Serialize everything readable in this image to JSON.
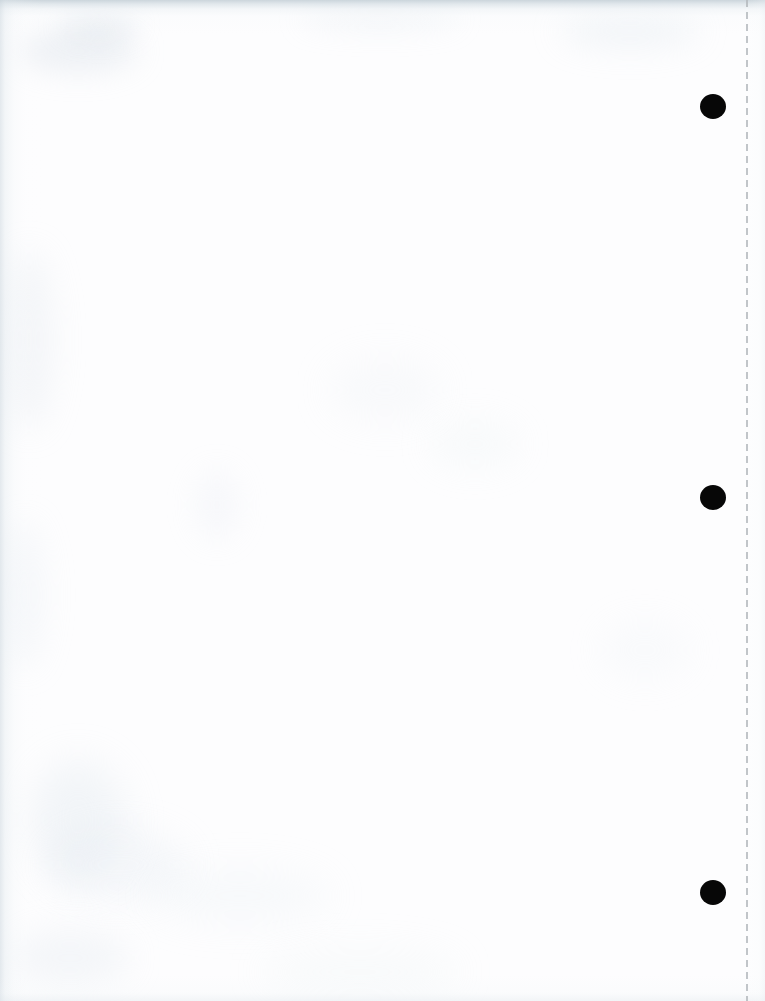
{
  "document": {
    "kind": "scanned-page",
    "description": "Blank scanned sheet of white paper",
    "page_width_px": 765,
    "page_height_px": 1001,
    "text_content": "",
    "paper_color": "#fdfdfe",
    "background_color": "#ffffff"
  },
  "scan_edges": {
    "top": {
      "name": "top-edge-shadow",
      "color": "#c6d1d8",
      "height_px": 34
    },
    "left": {
      "name": "left-edge-shadow",
      "color": "#ced8df",
      "width_px": 44
    },
    "bottom": {
      "name": "bottom-edge-shadow",
      "color": "#e0e7ec",
      "height_px": 26
    },
    "right": {
      "name": "right-edge-shadow",
      "color": "#e9eef2",
      "width_px": 18
    }
  },
  "perforation": {
    "name": "vertical-dashed-tear-line",
    "color": "#b4b9bd",
    "x_px": 746,
    "dash_px": 7,
    "gap_px": 5,
    "thickness_px": 2,
    "opacity": 0.82
  },
  "punch_holes": {
    "color": "#070707",
    "count": 3,
    "diameter_px": 26,
    "items": [
      {
        "name": "punch-hole-top",
        "cx": 713,
        "cy": 107
      },
      {
        "name": "punch-hole-middle",
        "cx": 713,
        "cy": 498
      },
      {
        "name": "punch-hole-bottom",
        "cx": 713,
        "cy": 893
      }
    ]
  },
  "smudges": [
    {
      "name": "smudge-top-left-a",
      "x": 18,
      "y": 30,
      "w": 120,
      "h": 42,
      "color": "rgba(206,216,224,0.30)",
      "blur": 14
    },
    {
      "name": "smudge-top-left-b",
      "x": 60,
      "y": 12,
      "w": 78,
      "h": 26,
      "color": "rgba(198,210,219,0.26)",
      "blur": 12
    },
    {
      "name": "smudge-top-mid",
      "x": 300,
      "y": 8,
      "w": 160,
      "h": 22,
      "color": "rgba(214,224,231,0.22)",
      "blur": 13
    },
    {
      "name": "smudge-top-right",
      "x": 560,
      "y": 14,
      "w": 140,
      "h": 34,
      "color": "rgba(210,221,229,0.24)",
      "blur": 15
    },
    {
      "name": "smudge-left-mid-a",
      "x": 6,
      "y": 250,
      "w": 46,
      "h": 180,
      "color": "rgba(216,226,233,0.26)",
      "blur": 16
    },
    {
      "name": "smudge-left-mid-b",
      "x": 4,
      "y": 520,
      "w": 40,
      "h": 150,
      "color": "rgba(219,229,235,0.22)",
      "blur": 15
    },
    {
      "name": "smudge-center-faint",
      "x": 330,
      "y": 360,
      "w": 110,
      "h": 60,
      "color": "rgba(228,234,239,0.20)",
      "blur": 18
    },
    {
      "name": "smudge-mid-right",
      "x": 430,
      "y": 420,
      "w": 90,
      "h": 48,
      "color": "rgba(230,236,240,0.18)",
      "blur": 16
    },
    {
      "name": "smudge-lower-left-a",
      "x": 30,
      "y": 760,
      "w": 96,
      "h": 120,
      "color": "rgba(214,224,232,0.26)",
      "blur": 18
    },
    {
      "name": "smudge-lower-left-b",
      "x": 48,
      "y": 830,
      "w": 140,
      "h": 70,
      "color": "rgba(220,229,236,0.22)",
      "blur": 17
    },
    {
      "name": "smudge-lower-mid",
      "x": 150,
      "y": 870,
      "w": 180,
      "h": 52,
      "color": "rgba(226,233,238,0.20)",
      "blur": 18
    },
    {
      "name": "smudge-bottom-left",
      "x": 10,
      "y": 930,
      "w": 120,
      "h": 56,
      "color": "rgba(218,227,234,0.24)",
      "blur": 16
    },
    {
      "name": "smudge-bottom-mid",
      "x": 260,
      "y": 950,
      "w": 200,
      "h": 44,
      "color": "rgba(230,236,241,0.18)",
      "blur": 18
    },
    {
      "name": "smudge-right-mid",
      "x": 600,
      "y": 620,
      "w": 90,
      "h": 60,
      "color": "rgba(232,238,242,0.16)",
      "blur": 16
    },
    {
      "name": "smudge-lower-center",
      "x": 195,
      "y": 470,
      "w": 44,
      "h": 70,
      "color": "rgba(225,232,238,0.20)",
      "blur": 14
    }
  ]
}
